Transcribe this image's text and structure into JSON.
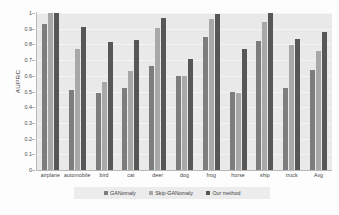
{
  "chart_data": {
    "type": "bar",
    "title": "",
    "xlabel": "",
    "ylabel": "AUPRC",
    "ylim": [
      0,
      1
    ],
    "yticks": [
      "0",
      "0.1",
      "0.2",
      "0.3",
      "0.4",
      "0.5",
      "0.6",
      "0.7",
      "0.8",
      "0.9",
      "1"
    ],
    "grid": true,
    "legend_position": "bottom",
    "categories": [
      "airplane",
      "automobile",
      "bird",
      "cat",
      "deer",
      "dog",
      "frog",
      "horse",
      "ship",
      "truck",
      "Avg"
    ],
    "series": [
      {
        "name": "GANomaly",
        "color": "#7d7d7d",
        "values": [
          0.93,
          0.51,
          0.49,
          0.52,
          0.665,
          0.6,
          0.85,
          0.5,
          0.82,
          0.52,
          0.64
        ]
      },
      {
        "name": "Skip-GANomaly",
        "color": "#a8a8a8",
        "values": [
          1.0,
          0.77,
          0.56,
          0.63,
          0.905,
          0.6,
          0.96,
          0.49,
          0.94,
          0.795,
          0.76
        ]
      },
      {
        "name": "Our method",
        "color": "#575757",
        "values": [
          1.0,
          0.91,
          0.815,
          0.825,
          0.97,
          0.705,
          0.995,
          0.77,
          1.0,
          0.835,
          0.88
        ]
      }
    ]
  },
  "legend": {
    "items": [
      {
        "label": "GANomaly"
      },
      {
        "label": "Skip-GANomaly"
      },
      {
        "label": "Our method"
      }
    ]
  },
  "caption": ""
}
